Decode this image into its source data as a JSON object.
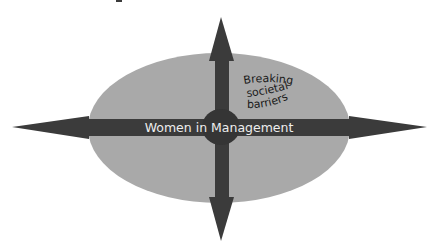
{
  "diagram": {
    "title_fragment": "",
    "center_label": "Women in Management",
    "corner_label_lines": [
      "Breaking",
      "societal",
      "barriers"
    ],
    "arrows": [
      "up",
      "down",
      "left",
      "right"
    ],
    "colors": {
      "background": "#ffffff",
      "ellipse_fill": "#a9a9a9",
      "arrow_fill": "#3b3b3b",
      "center_circle_fill": "#353535",
      "center_label_text": "#ededed",
      "corner_label_text": "#1a1a1a"
    }
  }
}
